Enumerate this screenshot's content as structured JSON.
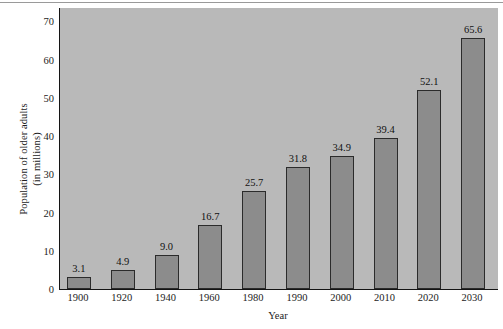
{
  "chart_data": {
    "type": "bar",
    "title": "",
    "xlabel": "Year",
    "ylabel_line1": "Population of older adults",
    "ylabel_line2": "(in millions)",
    "categories": [
      "1900",
      "1920",
      "1940",
      "1960",
      "1980",
      "1990",
      "2000",
      "2010",
      "2020",
      "2030"
    ],
    "values": [
      3.1,
      4.9,
      9.0,
      16.7,
      25.7,
      31.8,
      34.9,
      39.4,
      52.1,
      65.6
    ],
    "value_labels": [
      "3.1",
      "4.9",
      "9.0",
      "16.7",
      "25.7",
      "31.8",
      "34.9",
      "39.4",
      "52.1",
      "65.6"
    ],
    "yticks": [
      0,
      10,
      20,
      30,
      40,
      50,
      60,
      70
    ],
    "ytick_labels": [
      "0",
      "10",
      "20",
      "30",
      "40",
      "50",
      "60",
      "70"
    ],
    "ylim": [
      0,
      73.5
    ],
    "grid": false,
    "legend": null,
    "colors": {
      "bar_fill": "#8c8c8c",
      "bar_edge": "#2b2b2b",
      "plot_background": "#b9b9b9",
      "axis": "#141414",
      "text": "#1c1c1c",
      "page_background": "#ffffff"
    }
  }
}
